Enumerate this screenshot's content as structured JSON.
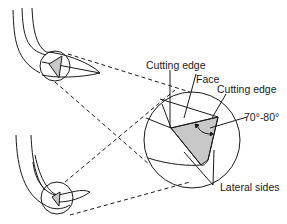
{
  "diagram": {
    "labels": {
      "cutting_edge_top": "Cutting edge",
      "face": "Face",
      "cutting_edge_right": "Cutting edge",
      "angle": "70°-80°",
      "lateral_sides": "Lateral sides"
    },
    "colors": {
      "stroke": "#1a1a1a",
      "face_fill": "#c8c8c8",
      "background": "#ffffff"
    }
  }
}
